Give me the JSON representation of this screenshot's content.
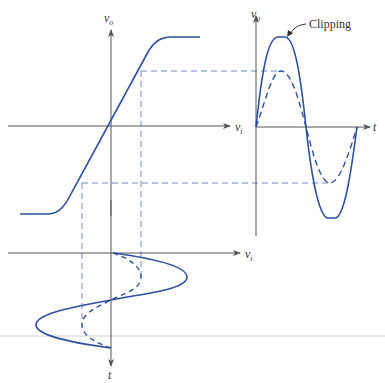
{
  "figure": {
    "colors": {
      "axis": "#555555",
      "curve": "#2e4f9e",
      "dashed": "#6f88c6",
      "separator": "#cccccc"
    }
  },
  "transfer_plot": {
    "y_axis_label": "v",
    "y_axis_sub": "o",
    "x_axis_label": "v",
    "x_axis_sub": "i"
  },
  "output_plot": {
    "y_axis_label": "v",
    "y_axis_sub": "o",
    "x_axis_label": "t",
    "annotation": "Clipping"
  },
  "input_plot": {
    "x_axis_label": "v",
    "x_axis_sub": "i",
    "y_axis_label": "t"
  }
}
